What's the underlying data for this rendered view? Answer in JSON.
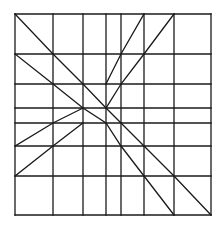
{
  "diagram": {
    "type": "grid-with-diagonals",
    "stroke_color": "#1a1a1a",
    "background": "#ffffff",
    "grid": {
      "columns_x": [
        15,
        53,
        83,
        106,
        121,
        144,
        174,
        211
      ],
      "rows_y": [
        14,
        54,
        84,
        108,
        123,
        146,
        176,
        215
      ]
    },
    "segments": [
      {
        "name": "main-diagonal",
        "points": [
          [
            15,
            14
          ],
          [
            53,
            54
          ],
          [
            83,
            84
          ],
          [
            106,
            108
          ],
          [
            121,
            123
          ],
          [
            144,
            146
          ],
          [
            174,
            176
          ],
          [
            211,
            215
          ]
        ]
      },
      {
        "name": "lower-diagonal",
        "points": [
          [
            15,
            54
          ],
          [
            53,
            84
          ],
          [
            83,
            108
          ],
          [
            106,
            123
          ],
          [
            121,
            146
          ],
          [
            144,
            176
          ],
          [
            174,
            215
          ]
        ]
      },
      {
        "name": "top-steep-line-1",
        "points": [
          [
            144,
            14
          ],
          [
            121,
            54
          ],
          [
            106,
            84
          ]
        ]
      },
      {
        "name": "top-steep-line-2",
        "points": [
          [
            174,
            14
          ],
          [
            144,
            54
          ],
          [
            121,
            84
          ],
          [
            106,
            108
          ]
        ]
      },
      {
        "name": "left-shallow-line-1",
        "points": [
          [
            15,
            146
          ],
          [
            53,
            123
          ],
          [
            83,
            108
          ]
        ]
      },
      {
        "name": "left-shallow-line-2",
        "points": [
          [
            15,
            176
          ],
          [
            53,
            146
          ],
          [
            83,
            123
          ]
        ]
      }
    ]
  }
}
